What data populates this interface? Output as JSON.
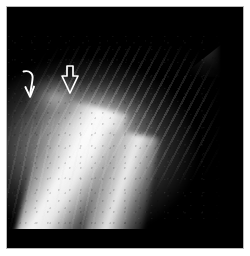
{
  "figure": {
    "modality": "radiograph",
    "region": "shoulder / proximal humerus",
    "orientation": "oblique",
    "background_color": "#ffffff",
    "film_color": "#000000",
    "frame_color": "#b9b9b9",
    "annotation_color": "#ffffff",
    "caption": ""
  },
  "annotations": [
    {
      "id": "curved-arrow",
      "icon": "curved-arrow-down-icon",
      "style": "solid-curved",
      "label": "",
      "points_to": "periosteal reaction at lateral cortex",
      "x": 10,
      "y": 60,
      "width": 26,
      "height": 34,
      "color": "#ffffff"
    },
    {
      "id": "hollow-arrow",
      "icon": "hollow-arrow-down-icon",
      "style": "open-outline",
      "label": "",
      "points_to": "lytic lesion margin",
      "x": 50,
      "y": 56,
      "width": 26,
      "height": 34,
      "color": "#ffffff"
    }
  ],
  "layers": [
    {
      "id": "soft-tissue-field",
      "name": "soft-tissue-envelope"
    },
    {
      "id": "humeral-head",
      "name": "humeral-head-density"
    },
    {
      "id": "cortical-shaft",
      "name": "cortical-shaft-streak"
    },
    {
      "id": "medial-cortex",
      "name": "medial-cortex-streak"
    },
    {
      "id": "lesion-zone",
      "name": "lesion-mottling"
    },
    {
      "id": "upper-right-wedge",
      "name": "upper-right-bright-wedge"
    },
    {
      "id": "rib-striations",
      "name": "oblique-rib-striations"
    },
    {
      "id": "lower-rib-striations",
      "name": "lower-rib-striations"
    },
    {
      "id": "film-grain",
      "name": "film-grain-speckle"
    }
  ]
}
